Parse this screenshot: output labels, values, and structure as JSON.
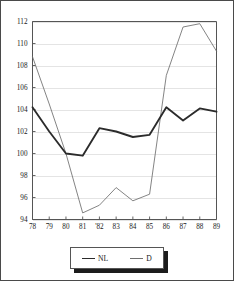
{
  "chart_data": {
    "type": "line",
    "title": "",
    "xlabel": "",
    "ylabel": "",
    "categories": [
      "78",
      "79",
      "80",
      "81",
      "'82",
      "83",
      "84",
      "85",
      "86",
      "87",
      "88",
      "89"
    ],
    "x_tick_labels": [
      "78",
      "79",
      "80",
      "81",
      "'82",
      "83",
      "84",
      "85",
      "86",
      "87",
      "88",
      "89"
    ],
    "y_tick_labels": [
      "94",
      "96",
      "98",
      "100",
      "102",
      "104",
      "106",
      "108",
      "110",
      "112"
    ],
    "y_tick_values": [
      94,
      96,
      98,
      100,
      102,
      104,
      106,
      108,
      110,
      112
    ],
    "ylim": [
      94,
      112
    ],
    "grid": true,
    "grid_axis": "y",
    "legend_position": "below-center",
    "series": [
      {
        "name": "NL",
        "style": "thick",
        "color": "#2b2b2b",
        "values": [
          104.2,
          102.0,
          100.0,
          99.8,
          102.3,
          102.0,
          101.5,
          101.7,
          104.2,
          103.0,
          104.1,
          103.8
        ]
      },
      {
        "name": "D",
        "style": "thin",
        "color": "#6e6e6e",
        "values": [
          108.8,
          104.5,
          100.0,
          94.6,
          95.3,
          96.9,
          95.7,
          96.3,
          107.1,
          111.5,
          111.8,
          109.3
        ]
      }
    ]
  },
  "legend": {
    "entries": [
      {
        "label": "NL"
      },
      {
        "label": "D"
      }
    ]
  },
  "colors": {
    "nl_line": "#2b2b2b",
    "d_line": "#6e6e6e",
    "grid": "#d8d8d8",
    "axis": "#555555",
    "background": "#ffffff"
  }
}
